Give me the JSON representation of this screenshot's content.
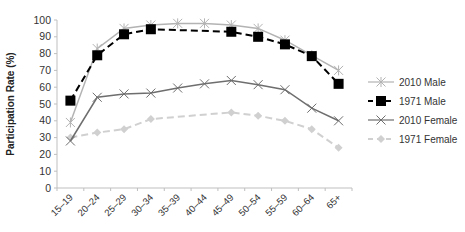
{
  "chart_data": {
    "type": "line",
    "title": "",
    "xlabel": "",
    "ylabel": "Participation Rate (%)",
    "ylim": [
      0,
      100
    ],
    "yticks": [
      0,
      10,
      20,
      30,
      40,
      50,
      60,
      70,
      80,
      90,
      100
    ],
    "grid": false,
    "legend_position": "right",
    "categories": [
      "15–19",
      "20–24",
      "25–29",
      "30–34",
      "35–39",
      "40–44",
      "45–49",
      "50–54",
      "55–59",
      "60–64",
      "65+"
    ],
    "series": [
      {
        "name": "2010 Male",
        "values": [
          39,
          83,
          95,
          97,
          98,
          98,
          97,
          95,
          88,
          79,
          70
        ],
        "markers": [
          true,
          true,
          true,
          true,
          true,
          true,
          true,
          true,
          true,
          true,
          true
        ],
        "color": "#b3b3b3",
        "dash": "solid",
        "marker": "asterisk"
      },
      {
        "name": "1971 Male",
        "values": [
          52,
          79,
          91.5,
          94.5,
          null,
          null,
          93,
          90,
          85.5,
          78.5,
          62
        ],
        "markers": [
          true,
          true,
          true,
          true,
          false,
          false,
          true,
          true,
          true,
          true,
          true
        ],
        "color": "#000000",
        "dash": "dashed",
        "marker": "square"
      },
      {
        "name": "2010 Female",
        "values": [
          28,
          54,
          56,
          56.5,
          59.5,
          62,
          64,
          61.5,
          58.5,
          47.5,
          40
        ],
        "markers": [
          true,
          true,
          true,
          true,
          true,
          true,
          true,
          true,
          true,
          true,
          true
        ],
        "color": "#6e6e6e",
        "dash": "solid",
        "marker": "x"
      },
      {
        "name": "1971 Female",
        "values": [
          30,
          33,
          35,
          41,
          null,
          null,
          45,
          43,
          40,
          35,
          24
        ],
        "markers": [
          true,
          true,
          true,
          true,
          false,
          false,
          true,
          true,
          true,
          true,
          true
        ],
        "color": "#d0d0d0",
        "dash": "dashed",
        "marker": "diamond"
      }
    ]
  }
}
